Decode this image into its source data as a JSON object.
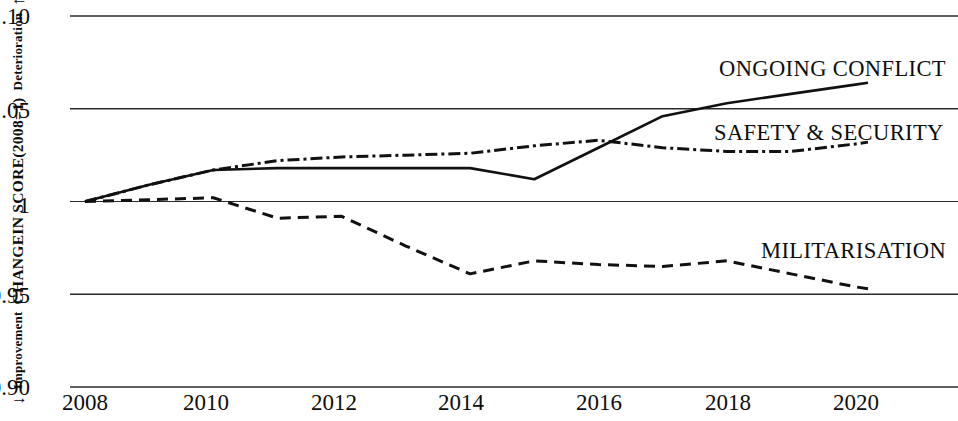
{
  "axis": {
    "y_title": "CHANGEIN SCORE(2008=1)",
    "y_top_label": "Deterioration",
    "y_bottom_label": "Improvement",
    "arrow_up": "↑",
    "arrow_down": "↓",
    "y_ticks": [
      "1.10",
      "1.05",
      "1",
      "0.95",
      "0.90"
    ],
    "x_ticks": [
      "2008",
      "2010",
      "2012",
      "2014",
      "2016",
      "2018",
      "2020"
    ]
  },
  "series_labels": {
    "ongoing_conflict": "ONGOING CONFLICT",
    "safety_security": "SAFETY & SECURITY",
    "militarisation": "MILITARISATION"
  },
  "colors": {
    "line": "#111111",
    "grid": "#2b2b2b",
    "background": "#ffffff"
  },
  "chart_data": {
    "type": "line",
    "title": "",
    "xlabel": "",
    "ylabel": "CHANGEIN SCORE(2008=1)",
    "xlim": [
      2008,
      2020.2
    ],
    "ylim": [
      0.9,
      1.1
    ],
    "yticks": [
      0.9,
      0.95,
      1.0,
      1.05,
      1.1
    ],
    "xticks": [
      2008,
      2010,
      2012,
      2014,
      2016,
      2018,
      2020
    ],
    "grid": true,
    "legend": "inline-annotations",
    "x": [
      2008,
      2009,
      2010,
      2011,
      2012,
      2013,
      2014,
      2015,
      2016,
      2017,
      2018,
      2019,
      2020,
      2020.2
    ],
    "series": [
      {
        "name": "ONGOING CONFLICT",
        "style": "solid",
        "values": [
          1.0,
          1.009,
          1.017,
          1.018,
          1.018,
          1.018,
          1.018,
          1.012,
          1.029,
          1.046,
          1.053,
          1.058,
          1.063,
          1.064
        ]
      },
      {
        "name": "SAFETY & SECURITY",
        "style": "dash-dot",
        "values": [
          1.0,
          1.009,
          1.017,
          1.022,
          1.024,
          1.025,
          1.026,
          1.03,
          1.033,
          1.029,
          1.027,
          1.027,
          1.031,
          1.032
        ]
      },
      {
        "name": "MILITARISATION",
        "style": "dashed",
        "values": [
          1.0,
          1.001,
          1.002,
          0.991,
          0.992,
          0.976,
          0.961,
          0.968,
          0.966,
          0.965,
          0.968,
          0.961,
          0.954,
          0.953
        ]
      }
    ]
  }
}
